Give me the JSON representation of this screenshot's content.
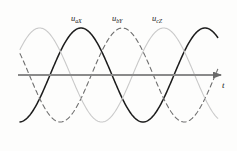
{
  "figure": {
    "title": "",
    "background_color": "#fdfdfc"
  },
  "axis": {
    "time_label": "t",
    "axis_color": "#8a8a8a",
    "x_start": 18,
    "x_end": 228,
    "baseline_y": 75
  },
  "labels": [
    {
      "base": "u",
      "sub": "aX",
      "x": 71,
      "y": 13
    },
    {
      "base": "u",
      "sub": "bY",
      "x": 112,
      "y": 13
    },
    {
      "base": "u",
      "sub": "cZ",
      "x": 152,
      "y": 13
    }
  ],
  "chart_data": {
    "type": "line",
    "title": "",
    "xlabel": "t",
    "ylabel": "",
    "grid": false,
    "legend": "inline-annotations",
    "xlim": [
      0,
      360
    ],
    "ylim": [
      -1.15,
      1.15
    ],
    "x_unit": "electrical degrees",
    "series": [
      {
        "name": "u_aX",
        "label": "uaX",
        "phase_deg": 0,
        "amplitude": 1.0,
        "style": "solid",
        "color": "#1c1c1c",
        "line_width": 1.5,
        "peak_value": 1.0,
        "trough_value": -1.0
      },
      {
        "name": "u_bY",
        "label": "ubY",
        "phase_deg": -120,
        "amplitude": 1.0,
        "style": "dashed",
        "color": "#6e6e6e",
        "line_width": 1.1,
        "peak_value": 1.0,
        "trough_value": -1.0
      },
      {
        "name": "u_cZ",
        "label": "ucZ",
        "phase_deg": -240,
        "amplitude": 1.0,
        "style": "solid",
        "color": "#c9c9c9",
        "line_width": 1.1,
        "peak_value": 1.0,
        "trough_value": -1.0
      }
    ],
    "x": [
      0,
      30,
      60,
      90,
      120,
      150,
      180,
      210,
      240,
      270,
      300,
      330,
      360
    ],
    "values_by_series": {
      "u_aX": [
        0,
        0.5,
        0.87,
        1,
        0.87,
        0.5,
        0,
        -0.5,
        -0.87,
        -1,
        -0.87,
        -0.5,
        0
      ],
      "u_bY": [
        -0.87,
        -0.5,
        0,
        0.5,
        0.87,
        1,
        0.87,
        0.5,
        0,
        -0.5,
        -0.87,
        -1,
        -0.87
      ],
      "u_cZ": [
        0.87,
        1,
        0.87,
        0.5,
        0,
        -0.5,
        -0.87,
        -1,
        -0.87,
        -0.5,
        0,
        0.5,
        0.87
      ]
    }
  }
}
